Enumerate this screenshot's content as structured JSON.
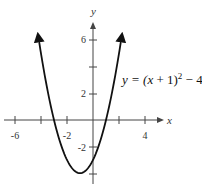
{
  "chart_data": {
    "type": "line",
    "title": "",
    "equation_label": "y = (x + 1)² − 4",
    "equation": {
      "prefix": "y = (",
      "x": "x",
      "mid": " + 1)",
      "exp": "2",
      "suffix": " − 4"
    },
    "xlabel": "x",
    "ylabel": "y",
    "xlim": [
      -7,
      5
    ],
    "ylim": [
      -4.5,
      7
    ],
    "x_ticks": [
      -6,
      -4,
      -2,
      0,
      2,
      4
    ],
    "x_tick_labels": [
      "-6",
      "-2",
      "4"
    ],
    "y_ticks": [
      -4,
      -2,
      2,
      4,
      6
    ],
    "y_tick_labels": [
      "6",
      "2",
      "-2"
    ],
    "grid": false,
    "series": [
      {
        "name": "y = (x+1)^2 - 4",
        "x": [
          -4.2,
          -4,
          -3,
          -2,
          -1,
          0,
          1,
          2,
          2.2
        ],
        "y": [
          6.24,
          5,
          0,
          -3,
          -4,
          -3,
          0,
          5,
          6.24
        ]
      }
    ],
    "vertex": [
      -1,
      -4
    ],
    "x_intercepts": [
      -3,
      1
    ],
    "y_intercept": -3
  }
}
